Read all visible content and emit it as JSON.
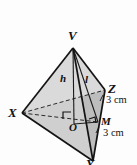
{
  "figure": {
    "kind": "tetrahedron-diagram",
    "vertices": [
      {
        "id": "V",
        "label": "V",
        "role": "apex",
        "x": 73,
        "y": 48
      },
      {
        "id": "X",
        "label": "X",
        "role": "base-vertex",
        "x": 22,
        "y": 113
      },
      {
        "id": "Z",
        "label": "Z",
        "role": "base-vertex",
        "x": 105,
        "y": 90
      },
      {
        "id": "Y",
        "label": "Y",
        "role": "base-vertex",
        "x": 93,
        "y": 161
      }
    ],
    "interior_points": [
      {
        "id": "O",
        "label": "O",
        "role": "base-centre-foot-of-height",
        "x": 74,
        "y": 124
      },
      {
        "id": "M",
        "label": "M",
        "role": "midpoint-of-edge-YZ",
        "x": 98,
        "y": 122
      }
    ],
    "segment_labels": [
      {
        "id": "h",
        "label": "h",
        "meaning": "perpendicular height from V to O",
        "x": 62,
        "y": 78
      },
      {
        "id": "l",
        "label": "l",
        "meaning": "slant height from V to M",
        "x": 87,
        "y": 79
      }
    ],
    "dimensions": [
      {
        "id": "dim-ZM",
        "text": "3 cm",
        "meaning": "length from Z to M",
        "x": 111,
        "y": 100
      },
      {
        "id": "dim-MY",
        "text": "3 cm",
        "meaning": "length from M to Y",
        "x": 108,
        "y": 133
      }
    ],
    "right_angle_markers": [
      {
        "id": "right-angle-at-O",
        "meaning": "VO perpendicular to base",
        "x": 64,
        "y": 114
      },
      {
        "id": "right-angle-at-M",
        "meaning": "VM perpendicular to YZ",
        "x": 94,
        "y": 119
      }
    ],
    "colors": {
      "stroke": "#1a1a1a",
      "face_light": "#dcdcdc",
      "face_mid": "#c9c9c9",
      "face_dark": "#b4b4b4",
      "background": "#fdfdfd",
      "text": "#111111"
    }
  }
}
